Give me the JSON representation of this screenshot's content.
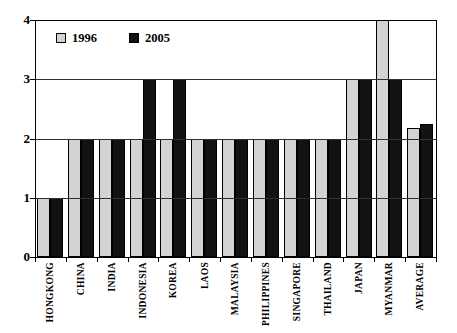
{
  "chart_data": {
    "type": "bar",
    "title": "",
    "xlabel": "",
    "ylabel": "",
    "categories": [
      "HONGKONG",
      "CHINA",
      "INDIA",
      "INDONESIA",
      "KOREA",
      "LAOS",
      "MALAYSIA",
      "PHILIPPINES",
      "SINGAPORE",
      "THAILAND",
      "JAPAN",
      "MYANMAR",
      "AVERAGE"
    ],
    "series": [
      {
        "name": "1996",
        "color": "#d3d3d3",
        "values": [
          1,
          2,
          2,
          2,
          2,
          2,
          2,
          2,
          2,
          2,
          3,
          4,
          2.17
        ]
      },
      {
        "name": "2005",
        "color": "#121212",
        "values": [
          1,
          2,
          2,
          3,
          3,
          2,
          2,
          2,
          2,
          2,
          3,
          3,
          2.25
        ]
      }
    ],
    "ylim": [
      0,
      4
    ],
    "yticks": [
      0,
      1,
      2,
      3,
      4
    ],
    "grid": true,
    "gridline_values": [
      1,
      2,
      3
    ],
    "legend_position": "top-left"
  },
  "colors": {
    "background": "#ffffff",
    "bar_border": "#000000",
    "gridline": "#2f2f2f",
    "axis": "#000000"
  }
}
